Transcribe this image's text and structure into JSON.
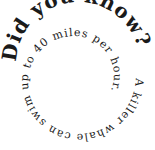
{
  "graphic": {
    "heading": "Did you know?",
    "fact": "A killer whale can swim up to 40 miles per hour.",
    "text_color": "#1a1a1a",
    "background": "#ffffff"
  }
}
